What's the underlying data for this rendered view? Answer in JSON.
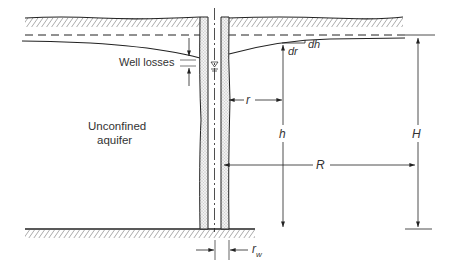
{
  "diagram": {
    "labels": {
      "aquifer_line1": "Unconfined",
      "aquifer_line2": "aquifer",
      "well_losses": "Well losses",
      "dr": "dr",
      "dh": "dh",
      "r": "r",
      "h": "h",
      "H": "H",
      "R": "R",
      "rw_main": "r",
      "rw_sub": "w"
    },
    "colors": {
      "line": "#222222",
      "text": "#333333",
      "gravel": "#bdbdbd"
    }
  }
}
